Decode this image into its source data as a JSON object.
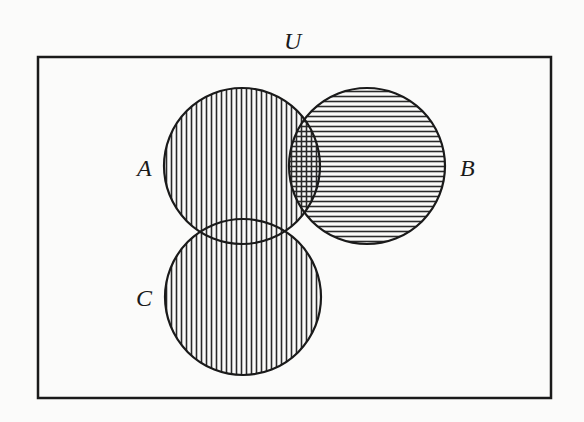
{
  "diagram": {
    "type": "venn",
    "universe": {
      "label": "U",
      "box": {
        "x": 38,
        "y": 57,
        "width": 513,
        "height": 341
      }
    },
    "sets": [
      {
        "id": "A",
        "label": "A",
        "cx": 242,
        "cy": 166,
        "r": 78,
        "shading": "vertical-lines",
        "label_x": 145,
        "label_y": 175
      },
      {
        "id": "B",
        "label": "B",
        "cx": 367,
        "cy": 166,
        "r": 78,
        "shading": "horizontal-lines",
        "label_x": 462,
        "label_y": 175
      },
      {
        "id": "C",
        "label": "C",
        "cx": 243,
        "cy": 297,
        "r": 78,
        "shading": "vertical-lines",
        "label_x": 138,
        "label_y": 306
      }
    ],
    "shaded_region": "A ∪ B ∪ C",
    "colors": {
      "stroke": "#1a1a1a",
      "hatch": "#2a2a2a",
      "background": "#fbfbfa"
    },
    "hatch_spacing_px": 5
  }
}
